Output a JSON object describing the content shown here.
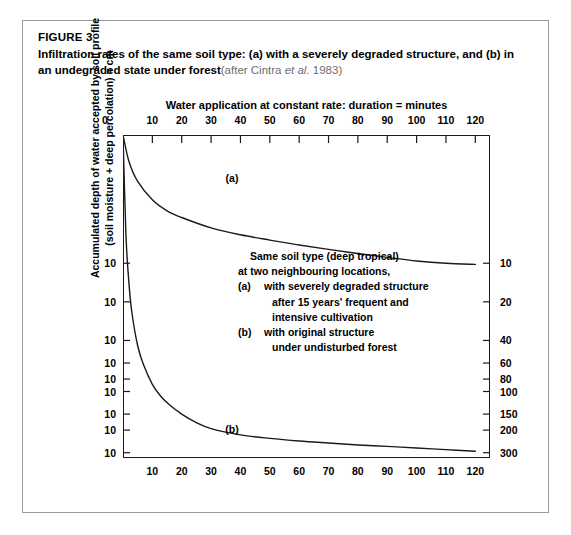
{
  "figure": {
    "kicker": "FIGURE 3",
    "title_part1": "Infiltration rates of the same soil type: (a) with a severely degraded structure, and (b) in an",
    "title_part2": "undegraded state under forest",
    "source_prefix": "(after Cintra ",
    "source_italic": "et al.",
    "source_suffix": " 1983)"
  },
  "chart_data": {
    "type": "line",
    "title": "Infiltration rates of the same soil type: (a) with a severely degraded structure, and (b) in an undegraded state under forest",
    "xlabel": "Water application at constant rate: duration = minutes",
    "ylabel_line1": "Accumulated depth of water accepted by soil profile",
    "ylabel_line2": "(soil moisture + deep percolation) = cm",
    "xlim": [
      0,
      125
    ],
    "ylim_log": [
      1,
      330
    ],
    "grid": false,
    "legend": "none",
    "x_origin_label": "0",
    "x_ticks_top": [
      10,
      20,
      30,
      40,
      50,
      60,
      70,
      80,
      90,
      100,
      110,
      120
    ],
    "x_ticks_bottom": [
      10,
      20,
      30,
      40,
      50,
      60,
      70,
      80,
      90,
      100,
      110,
      120
    ],
    "y_ticks_left_labels": [
      "10",
      "10",
      "10",
      "10",
      "10",
      "10",
      "10",
      "10",
      "10"
    ],
    "y_ticks_right": [
      10,
      20,
      40,
      60,
      80,
      100,
      150,
      200,
      300
    ],
    "series": [
      {
        "name": "(a)",
        "label": "(a)",
        "description": "with a severely degraded structure",
        "x": [
          0,
          2,
          5,
          10,
          15,
          20,
          30,
          40,
          50,
          60,
          70,
          80,
          90,
          100,
          110,
          120
        ],
        "y": [
          1.0,
          1.6,
          2.3,
          3.2,
          3.9,
          4.4,
          5.3,
          6.0,
          6.6,
          7.2,
          7.8,
          8.4,
          9.0,
          9.6,
          10.0,
          10.2
        ]
      },
      {
        "name": "(b)",
        "label": "(b)",
        "description": "with original structure under undisturbed forest",
        "x": [
          0,
          1,
          2,
          3,
          5,
          7,
          10,
          13,
          16,
          20,
          25,
          30,
          40,
          50,
          60,
          70,
          80,
          90,
          100,
          110,
          120
        ],
        "y": [
          1.0,
          6,
          14,
          24,
          44,
          62,
          88,
          110,
          128,
          150,
          175,
          195,
          218,
          232,
          243,
          252,
          261,
          268,
          276,
          284,
          292
        ]
      }
    ],
    "annotation": {
      "lines": [
        {
          "tag": "",
          "text": "Same soil type (deep tropical)",
          "indent": 1
        },
        {
          "tag": "",
          "text": "at two neighbouring locations,",
          "indent": 0
        },
        {
          "tag": "(a)",
          "text": "with severely degraded structure",
          "indent": 0
        },
        {
          "tag": "",
          "text": "after 15 years' frequent and",
          "indent": 2
        },
        {
          "tag": "",
          "text": "intensive cultivation",
          "indent": 2
        },
        {
          "tag": "(b)",
          "text": "with original structure",
          "indent": 0
        },
        {
          "tag": "",
          "text": "under undisturbed forest",
          "indent": 2
        }
      ]
    },
    "colors": {
      "axis": "#1a1a1a",
      "curve": "#1a1a1a",
      "frame": "#9a9a9a",
      "source_text": "#6e6e6e"
    }
  }
}
